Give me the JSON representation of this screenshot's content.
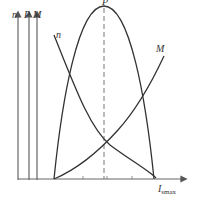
{
  "diagram": {
    "axes": {
      "y_labels": [
        "n",
        "P",
        "M"
      ],
      "x_label": "I",
      "x_label_subscript": "smax"
    },
    "curves": [
      {
        "name": "P",
        "label": "P",
        "shape": "parabola",
        "peak_marked_with_dashed_line": true
      },
      {
        "name": "n",
        "label": "n",
        "shape": "decreasing"
      },
      {
        "name": "M",
        "label": "M",
        "shape": "increasing"
      }
    ],
    "colors": {
      "line": "#333333",
      "axis": "#666666",
      "dashed": "#777777"
    }
  }
}
